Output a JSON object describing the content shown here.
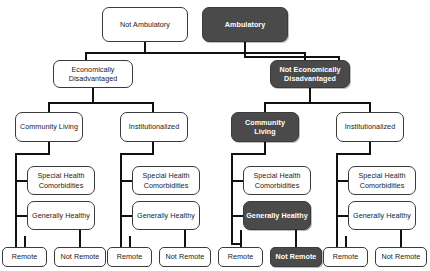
{
  "diagram": {
    "type": "decision-tree",
    "title": "",
    "highlight_color": "#4a4a4a",
    "default_fill": "#ffffff",
    "levels": [
      "Ambulatory status",
      "Economic status",
      "Living setting",
      "Health status",
      "Remote outcome"
    ],
    "nodes": {
      "root_left": "Not Ambulatory",
      "root_right": "Ambulatory",
      "econ_dis_left": "Economically Disadvantaged",
      "econ_notdis_right": "Not Economically Disadvantaged",
      "c1_community": "Community Living",
      "c1_institutional": "Institutionalized",
      "c2_community": "Community Living",
      "c2_institutional": "Institutionalized",
      "g1_special": "Special Health Comorbidities",
      "g1_healthy": "Generally Healthy",
      "g2_special": "Special Health Comorbidities",
      "g2_healthy": "Generally Healthy",
      "g3_special": "Special Health Comorbidities",
      "g3_healthy": "Generally Healthy",
      "g4_special": "Special Health Comorbidities",
      "g4_healthy": "Generally Healthy",
      "leaf_remote": "Remote",
      "leaf_not_remote": "Not Remote"
    },
    "highlighted_path": [
      "Ambulatory",
      "Not Economically Disadvantaged",
      "Community Living",
      "Generally Healthy",
      "Not Remote"
    ]
  }
}
